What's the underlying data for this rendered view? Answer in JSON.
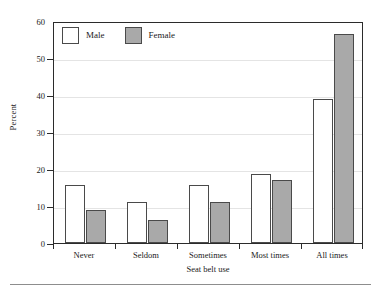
{
  "chart_data": {
    "type": "bar",
    "title": "",
    "xlabel": "Seat belt use",
    "ylabel": "Percent",
    "categories": [
      "Never",
      "Seldom",
      "Sometimes",
      "Most times",
      "All times"
    ],
    "series": [
      {
        "name": "Male",
        "color": "#ffffff",
        "values": [
          15.8,
          11.2,
          15.8,
          18.6,
          39.0
        ]
      },
      {
        "name": "Female",
        "color": "#a9a9a9",
        "values": [
          8.9,
          6.2,
          11.0,
          17.0,
          56.5
        ]
      }
    ],
    "ylim": [
      0,
      60
    ],
    "yticks": [
      0,
      10,
      20,
      30,
      40,
      50,
      60
    ],
    "ytick_labels": [
      "0",
      "10",
      "20",
      "30",
      "40",
      "50",
      "60"
    ],
    "grid": true,
    "legend_position": "upper left",
    "legend_entries": [
      "Male",
      "Female"
    ]
  },
  "axes": {
    "ylabel": "Percent",
    "xlabel": "Seat belt use"
  }
}
